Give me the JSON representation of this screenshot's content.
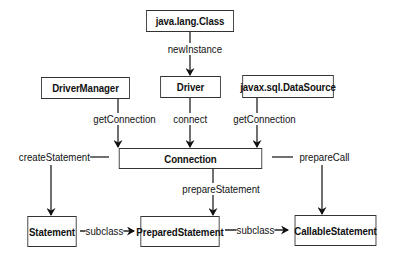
{
  "diagram": {
    "nodes": {
      "java_lang_class": "java.lang.Class",
      "driver_manager": "DriverManager",
      "driver": "Driver",
      "data_source": "javax.sql.DataSource",
      "connection": "Connection",
      "statement": "Statement",
      "prepared_statement": "PreparedStatement",
      "callable_statement": "CallableStatement"
    },
    "edges": {
      "new_instance": "newInstance",
      "dm_get_connection": "getConnection",
      "connect": "connect",
      "ds_get_connection": "getConnection",
      "create_statement": "createStatement",
      "prepare_statement": "prepareStatement",
      "prepare_call": "prepareCall",
      "subclass_1": "subclass",
      "subclass_2": "subclass"
    },
    "colors": {
      "line": "#222222",
      "box_border": "#333333",
      "background": "#ffffff"
    }
  }
}
